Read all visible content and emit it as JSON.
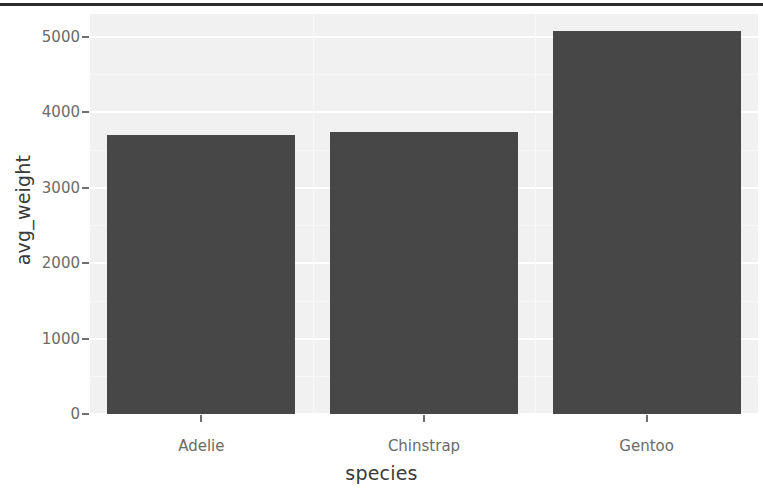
{
  "chart_data": {
    "type": "bar",
    "title": "",
    "subtitle": "",
    "xlabel": "species",
    "ylabel": "avg_weight",
    "categories": [
      "Adelie",
      "Chinstrap",
      "Gentoo"
    ],
    "values": [
      3701,
      3733,
      5076
    ],
    "series": [
      {
        "name": "avg_weight",
        "values": [
          3701,
          3733,
          5076
        ]
      }
    ],
    "ylim": [
      0,
      5300
    ],
    "yticks": [
      0,
      1000,
      2000,
      3000,
      4000,
      5000
    ],
    "ytick_labels": [
      "0",
      "1000",
      "2000",
      "3000",
      "4000",
      "5000"
    ],
    "xtick_labels": [
      "Adelie",
      "Chinstrap",
      "Gentoo"
    ],
    "grid": true,
    "grid_color": "#ffffff",
    "legend": "none",
    "bar_color": "#474747",
    "panel_background": "#f1f1f1",
    "axis_text_color": "#6b6b6b",
    "axis_title_color": "#3a3a3a"
  },
  "axes": {
    "y_title": "avg_weight",
    "x_title": "species",
    "y_tick_labels": [
      "5000",
      "4000",
      "3000",
      "2000",
      "1000",
      "0"
    ],
    "x_tick_labels": [
      "Adelie",
      "Chinstrap",
      "Gentoo"
    ]
  }
}
